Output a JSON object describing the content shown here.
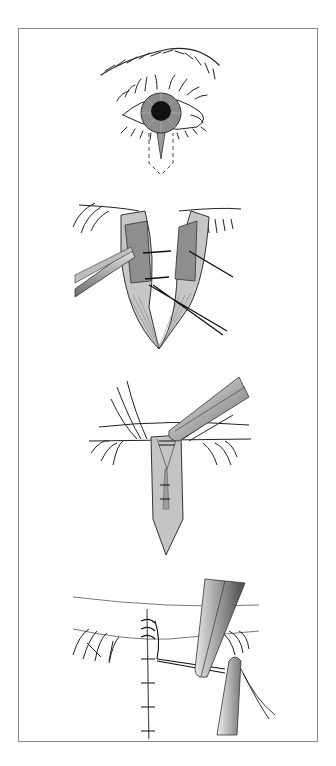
{
  "figure": {
    "frame_color": "#8a8a8a",
    "panels": [
      {
        "id": "step-1",
        "subject": "eye-with-lid-incision-outline"
      },
      {
        "id": "step-2",
        "subject": "lid-margin-split-with-forceps-and-sutures"
      },
      {
        "id": "step-3",
        "subject": "wedge-closure-with-needle-holder"
      },
      {
        "id": "step-4",
        "subject": "sutured-lid-with-forceps-tying"
      }
    ],
    "colors": {
      "line": "#222222",
      "tissue_light": "#d4d4d4",
      "tissue_mid": "#a8a8a8",
      "tissue_dark": "#6a6a6a",
      "iris": "#8c8c8c",
      "pupil": "#111111"
    }
  }
}
